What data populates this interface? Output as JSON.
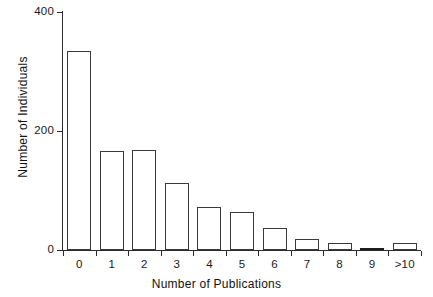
{
  "chart_data": {
    "type": "bar",
    "title": "",
    "xlabel": "Number of Publications",
    "ylabel": "Number of Individuals",
    "categories": [
      "0",
      "1",
      "2",
      "3",
      "4",
      "5",
      "6",
      "7",
      "8",
      "9",
      ">10"
    ],
    "values": [
      335,
      166,
      168,
      112,
      72,
      64,
      37,
      19,
      11,
      4,
      11
    ],
    "ylim": [
      0,
      400
    ],
    "ytick_labels": [
      "0",
      "200",
      "400"
    ],
    "ytick_values": [
      0,
      200,
      400
    ],
    "grid": false,
    "legend": null,
    "series": [
      {
        "name": "Number of Individuals",
        "values": [
          335,
          166,
          168,
          112,
          72,
          64,
          37,
          19,
          11,
          4,
          11
        ]
      }
    ],
    "bar_style": {
      "fill": "#ffffff",
      "edge": "#3a3a3a",
      "solid_fill_categories": [
        "9"
      ]
    }
  },
  "axes": {
    "x_title": "Number of Publications",
    "y_title": "Number of Individuals"
  }
}
